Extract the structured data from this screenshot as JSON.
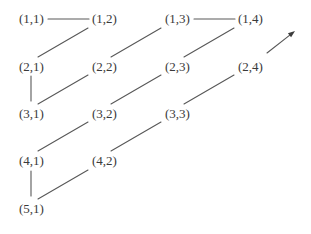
{
  "figure": {
    "name": "pair-enumeration-lattice",
    "background_color": "#ffffff",
    "text_color": "#3a3a3a",
    "line_color": "#585858",
    "width": 311,
    "height": 234
  },
  "nodes": [
    {
      "id": "n-1-1",
      "label": "(1,1)",
      "row": 1,
      "col": 1,
      "x": 18,
      "y": 12
    },
    {
      "id": "n-1-2",
      "label": "(1,2)",
      "row": 1,
      "col": 2,
      "x": 91,
      "y": 12
    },
    {
      "id": "n-1-3",
      "label": "(1,3)",
      "row": 1,
      "col": 3,
      "x": 164,
      "y": 12
    },
    {
      "id": "n-1-4",
      "label": "(1,4)",
      "row": 1,
      "col": 4,
      "x": 237,
      "y": 12
    },
    {
      "id": "n-2-1",
      "label": "(2,1)",
      "row": 2,
      "col": 1,
      "x": 18,
      "y": 60
    },
    {
      "id": "n-2-2",
      "label": "(2,2)",
      "row": 2,
      "col": 2,
      "x": 91,
      "y": 60
    },
    {
      "id": "n-2-3",
      "label": "(2,3)",
      "row": 2,
      "col": 3,
      "x": 164,
      "y": 60
    },
    {
      "id": "n-2-4",
      "label": "(2,4)",
      "row": 2,
      "col": 4,
      "x": 237,
      "y": 60
    },
    {
      "id": "n-3-1",
      "label": "(3,1)",
      "row": 3,
      "col": 1,
      "x": 18,
      "y": 107
    },
    {
      "id": "n-3-2",
      "label": "(3,2)",
      "row": 3,
      "col": 2,
      "x": 91,
      "y": 107
    },
    {
      "id": "n-3-3",
      "label": "(3,3)",
      "row": 3,
      "col": 3,
      "x": 164,
      "y": 107
    },
    {
      "id": "n-4-1",
      "label": "(4,1)",
      "row": 4,
      "col": 1,
      "x": 18,
      "y": 154
    },
    {
      "id": "n-4-2",
      "label": "(4,2)",
      "row": 4,
      "col": 2,
      "x": 91,
      "y": 154
    },
    {
      "id": "n-5-1",
      "label": "(5,1)",
      "row": 5,
      "col": 1,
      "x": 18,
      "y": 202
    }
  ],
  "edges": [
    {
      "name": "edge-11-12",
      "kind": "horizontal",
      "from": "(1,1)",
      "to": "(1,2)",
      "x1": 48,
      "y1": 19,
      "x2": 89,
      "y2": 19
    },
    {
      "name": "edge-13-14",
      "kind": "horizontal",
      "from": "(1,3)",
      "to": "(1,4)",
      "x1": 194,
      "y1": 19,
      "x2": 235,
      "y2": 19
    },
    {
      "name": "edge-21-12",
      "kind": "diagonal",
      "from": "(2,1)",
      "to": "(1,2)",
      "x1": 38,
      "y1": 57,
      "x2": 88,
      "y2": 28
    },
    {
      "name": "edge-31-22",
      "kind": "diagonal",
      "from": "(3,1)",
      "to": "(2,2)",
      "x1": 38,
      "y1": 104,
      "x2": 88,
      "y2": 75
    },
    {
      "name": "edge-41-32",
      "kind": "diagonal",
      "from": "(4,1)",
      "to": "(3,2)",
      "x1": 38,
      "y1": 151,
      "x2": 88,
      "y2": 122
    },
    {
      "name": "edge-51-42",
      "kind": "diagonal",
      "from": "(5,1)",
      "to": "(4,2)",
      "x1": 38,
      "y1": 199,
      "x2": 88,
      "y2": 170
    },
    {
      "name": "edge-22-13",
      "kind": "diagonal",
      "from": "(2,2)",
      "to": "(1,3)",
      "x1": 111,
      "y1": 57,
      "x2": 161,
      "y2": 28
    },
    {
      "name": "edge-32-23",
      "kind": "diagonal",
      "from": "(3,2)",
      "to": "(2,3)",
      "x1": 111,
      "y1": 104,
      "x2": 161,
      "y2": 75
    },
    {
      "name": "edge-42-33",
      "kind": "diagonal",
      "from": "(4,2)",
      "to": "(3,3)",
      "x1": 111,
      "y1": 151,
      "x2": 161,
      "y2": 122
    },
    {
      "name": "edge-23-14",
      "kind": "diagonal",
      "from": "(2,3)",
      "to": "(1,4)",
      "x1": 184,
      "y1": 57,
      "x2": 234,
      "y2": 28
    },
    {
      "name": "edge-33-24",
      "kind": "diagonal",
      "from": "(3,3)",
      "to": "(2,4)",
      "x1": 184,
      "y1": 104,
      "x2": 234,
      "y2": 75
    },
    {
      "name": "edge-21-31",
      "kind": "vertical",
      "from": "(2,1)",
      "to": "(3,1)",
      "x1": 31,
      "y1": 76,
      "x2": 31,
      "y2": 101
    },
    {
      "name": "edge-41-51",
      "kind": "vertical",
      "from": "(4,1)",
      "to": "(5,1)",
      "x1": 31,
      "y1": 171,
      "x2": 31,
      "y2": 196
    }
  ],
  "arrow": {
    "name": "continuation-arrow",
    "x1": 267,
    "y1": 53,
    "x2": 295,
    "y2": 31
  }
}
